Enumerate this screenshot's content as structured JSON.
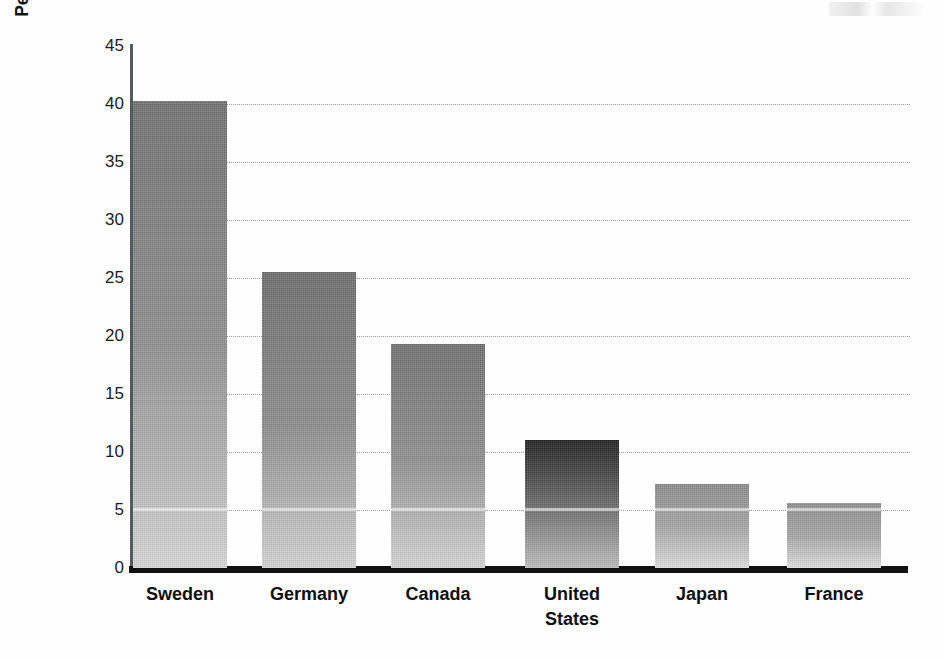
{
  "chart_data": {
    "type": "bar",
    "title": "",
    "subtitle": "",
    "xlabel": "",
    "ylabel": "Percentage of females in federal legislature, 1995",
    "categories": [
      "Sweden",
      "Germany",
      "Canada",
      "United States",
      "Japan",
      "France"
    ],
    "values": [
      40.3,
      25.5,
      19.3,
      11.0,
      7.2,
      5.6
    ],
    "series": [
      {
        "name": "Percentage of females in federal legislature, 1995",
        "values": [
          40.3,
          25.5,
          19.3,
          11.0,
          7.2,
          5.6
        ]
      }
    ],
    "ylim": [
      0,
      45
    ],
    "yticks": [
      0,
      5,
      10,
      15,
      20,
      25,
      30,
      35,
      40,
      45
    ],
    "ytick_labels": [
      "0",
      "5",
      "10",
      "15",
      "20",
      "25",
      "30",
      "35",
      "40",
      "45"
    ],
    "grid": true,
    "grid_axis": "y",
    "grid_style": "dotted",
    "legend": false,
    "legend_position": "none",
    "annotations": [],
    "bar_fill": "vertical grayscale gradient, dark top to light bottom",
    "bar_colors_top": [
      "#6f6f6f",
      "#6b6b6b",
      "#6e6e6e",
      "#1d1d1d",
      "#8a8a8a",
      "#8d8d8d"
    ],
    "bar_colors_mid": [
      "#8e8e8e",
      "#8b8b8b",
      "#8f8f8f",
      "#6a6a6a",
      "#a5a5a5",
      "#a6a6a6"
    ],
    "bar_colors_bottom": [
      "#d6d6d6",
      "#d3d3d3",
      "#d5d5d5",
      "#bdbdbd",
      "#dedede",
      "#dedede"
    ]
  },
  "axes": {
    "y_title": "Percentage of females in federal legislature, 1995",
    "y_tick_labels": [
      "45",
      "40",
      "35",
      "30",
      "25",
      "20",
      "15",
      "10",
      "5",
      "0"
    ],
    "x_tick_labels": [
      "Sweden",
      "Germany",
      "Canada",
      "United States",
      "Japan",
      "France"
    ]
  },
  "colors": {
    "axis": "#111111",
    "y_axis_line": "#555a5e",
    "gridline": "#9a9a9a",
    "text": "#111111",
    "background": "#ffffff"
  }
}
